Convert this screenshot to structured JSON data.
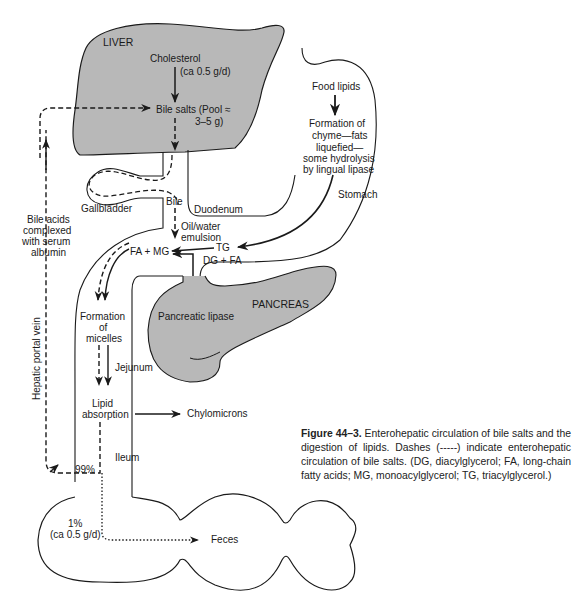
{
  "diagram": {
    "title": "Enterohepatic circulation of bile salts and the digestion of lipids",
    "organs": {
      "liver": "LIVER",
      "gallbladder": "Gallbladder",
      "duodenum": "Duodenum",
      "stomach": "Stomach",
      "pancreas": "PANCREAS",
      "jejunum": "Jejunum",
      "ileum": "Ileum",
      "hepatic_portal_vein": "Hepatic portal vein"
    },
    "labels": {
      "cholesterol": "Cholesterol",
      "cholesterol_rate": "(ca 0.5 g/d)",
      "bile_salts_1": "Bile salts (Pool ≈",
      "bile_salts_2": "3–5 g)",
      "bile": "Bile",
      "oil_water_1": "Oil/water",
      "oil_water_2": "emulsion",
      "tg": "TG",
      "dg_fa": "DG + FA",
      "fa_mg": "FA + MG",
      "pancreatic_lipase": "Pancreatic lipase",
      "food_lipids": "Food lipids",
      "chyme_1": "Formation of",
      "chyme_2": "chyme—fats",
      "chyme_3": "liquefied—",
      "chyme_4": "some hydrolysis",
      "chyme_5": "by lingual lipase",
      "micelles_1": "Formation",
      "micelles_2": "of",
      "micelles_3": "micelles",
      "lipid_abs_1": "Lipid",
      "lipid_abs_2": "absorption",
      "chylomicrons": "Chylomicrons",
      "bile_acids_1": "Bile acids",
      "bile_acids_2": "complexed",
      "bile_acids_3": "with serum",
      "bile_acids_4": "albumin",
      "pct_99": "99%",
      "pct_1": "1%",
      "pct_1_rate": "(ca 0.5 g/d)",
      "feces": "Feces"
    },
    "legend": {
      "dashed": "enterohepatic circulation of bile salts",
      "dotted": "loss to feces",
      "solid": "lipid digestion flow"
    },
    "colors": {
      "organ_fill": "#b8b8b8",
      "stroke": "#1a1a1a",
      "background": "#ffffff"
    }
  },
  "caption": {
    "figure_label": "Figure 44–3.",
    "text": " Enterohepatic circulation of bile salts and the digestion of lipids. Dashes (-----) indicate enterohepatic circulation of bile salts. (DG, diacylglycerol; FA, long-chain fatty acids; MG, monoacylglycerol; TG, triacylglycerol.)"
  }
}
